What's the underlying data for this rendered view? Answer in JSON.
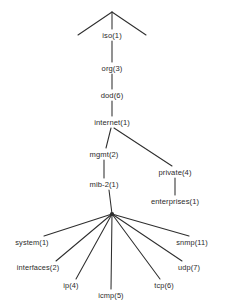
{
  "diagram": {
    "type": "tree",
    "background_color": "#ffffff",
    "line_color": "#2e2e2e",
    "text_color": "#2b2b2b",
    "nodes": [
      {
        "id": "iso",
        "label": "iso(1)",
        "x": 112,
        "y": 36,
        "level": 0
      },
      {
        "id": "org",
        "label": "org(3)",
        "x": 112,
        "y": 69,
        "level": 1
      },
      {
        "id": "dod",
        "label": "dod(6)",
        "x": 112,
        "y": 96,
        "level": 2
      },
      {
        "id": "internet",
        "label": "internet(1)",
        "x": 112,
        "y": 123,
        "level": 3
      },
      {
        "id": "mgmt",
        "label": "mgmt(2)",
        "x": 104,
        "y": 155,
        "level": 4
      },
      {
        "id": "private",
        "label": "private(4)",
        "x": 175,
        "y": 173,
        "level": 4
      },
      {
        "id": "mib2",
        "label": "mib-2(1)",
        "x": 104,
        "y": 185,
        "level": 5
      },
      {
        "id": "enterprises",
        "label": "enterprises(1)",
        "x": 175,
        "y": 202,
        "level": 5
      },
      {
        "id": "system",
        "label": "system(1)",
        "x": 32,
        "y": 243,
        "level": 6
      },
      {
        "id": "interfaces",
        "label": "interfaces(2)",
        "x": 38,
        "y": 268,
        "level": 6
      },
      {
        "id": "ip",
        "label": "ip(4)",
        "x": 71,
        "y": 286,
        "level": 6
      },
      {
        "id": "icmp",
        "label": "icmp(5)",
        "x": 111,
        "y": 296,
        "level": 6
      },
      {
        "id": "tcp",
        "label": "tcp(6)",
        "x": 164,
        "y": 286,
        "level": 6
      },
      {
        "id": "udp",
        "label": "udp(7)",
        "x": 189,
        "y": 268,
        "level": 6
      },
      {
        "id": "snmp",
        "label": "snmp(11)",
        "x": 192,
        "y": 243,
        "level": 6
      }
    ],
    "edges": [
      {
        "from": "apex",
        "to": "apex-left-wing"
      },
      {
        "from": "apex",
        "to": "apex-right-wing"
      },
      {
        "from": "apex",
        "to": "iso"
      },
      {
        "from": "iso",
        "to": "org"
      },
      {
        "from": "org",
        "to": "dod"
      },
      {
        "from": "dod",
        "to": "internet"
      },
      {
        "from": "internet",
        "to": "mgmt"
      },
      {
        "from": "internet",
        "to": "private"
      },
      {
        "from": "mgmt",
        "to": "mib2"
      },
      {
        "from": "private",
        "to": "enterprises"
      },
      {
        "from": "mib2",
        "to": "system"
      },
      {
        "from": "mib2",
        "to": "interfaces"
      },
      {
        "from": "mib2",
        "to": "ip"
      },
      {
        "from": "mib2",
        "to": "icmp"
      },
      {
        "from": "mib2",
        "to": "tcp"
      },
      {
        "from": "mib2",
        "to": "udp"
      },
      {
        "from": "mib2",
        "to": "snmp"
      }
    ],
    "fan_hub": {
      "x": 112,
      "y": 214
    },
    "apex": {
      "x": 112,
      "y": 12
    }
  }
}
